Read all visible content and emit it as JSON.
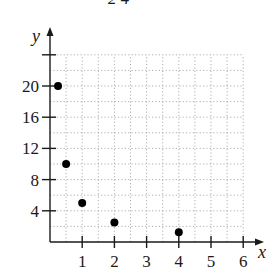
{
  "header": {
    "partial_text": "2  4"
  },
  "chart_data": {
    "type": "scatter",
    "title": "",
    "xlabel": "x",
    "ylabel": "y",
    "xlim": [
      0,
      6
    ],
    "ylim": [
      0,
      24
    ],
    "x_ticks": [
      1,
      2,
      3,
      4,
      5,
      6
    ],
    "x_tick_labels": [
      "1",
      "2",
      "3",
      "4",
      "5",
      "6"
    ],
    "y_ticks": [
      4,
      8,
      12,
      16,
      20,
      24
    ],
    "y_tick_labels": [
      "4",
      "8",
      "12",
      "16",
      "20",
      ""
    ],
    "grid": true,
    "grid_step_x": 0.5,
    "grid_step_y": 2,
    "legend": null,
    "series": [
      {
        "name": "points",
        "x": [
          0.25,
          0.5,
          1,
          2,
          4
        ],
        "y": [
          20,
          10,
          5,
          2.5,
          1.25
        ]
      }
    ],
    "colors": {
      "points": "#000000",
      "axis": "#1a1a1a",
      "grid": "#9a9a9a"
    }
  }
}
